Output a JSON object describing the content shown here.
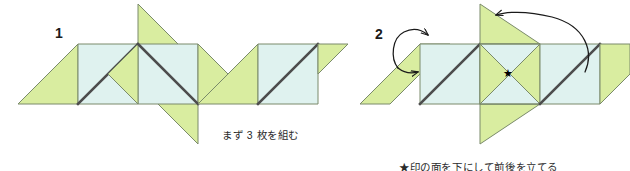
{
  "figure": {
    "background_color": "#ffffff",
    "width": 630,
    "height": 171
  },
  "palette": {
    "paper_green": "#d9eda0",
    "paper_mint": "#dff2ef",
    "outline": "#7a8a6a",
    "fold_line": "#4d4d4d",
    "arrow": "#1a1a1a",
    "text": "#2b2b2b"
  },
  "steps": [
    {
      "number": "1",
      "caption": "まず 3 枚を組む",
      "description": "three-units-assembled"
    },
    {
      "number": "2",
      "caption": "★印の面を下にして前後を立てる",
      "description": "flip-star-face-down-and-raise-front-and-back"
    }
  ],
  "markers": {
    "star": "★",
    "star_label": "star-marker"
  },
  "arrows": [
    {
      "name": "curved-arrow-up-right",
      "direction": "up-right"
    },
    {
      "name": "curved-arrow-sweep-left",
      "direction": "left"
    }
  ],
  "icons": {
    "star_icon": "star-icon",
    "arrow_icon": "curved-arrow-icon"
  }
}
